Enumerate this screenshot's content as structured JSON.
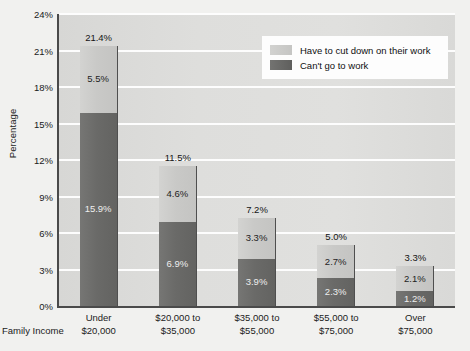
{
  "chart_data": {
    "type": "bar",
    "stacked": true,
    "title": "",
    "xlabel": "Family Income",
    "ylabel": "Percentage",
    "ylim": [
      0,
      24
    ],
    "yticks": [
      "0%",
      "3%",
      "6%",
      "9%",
      "12%",
      "15%",
      "18%",
      "21%",
      "24%"
    ],
    "ytick_values": [
      0,
      3,
      6,
      9,
      12,
      15,
      18,
      21,
      24
    ],
    "grid": true,
    "legend_position": "top-right",
    "categories": [
      "Under\n$20,000",
      "$20,000 to\n$35,000",
      "$35,000 to\n$55,000",
      "$55,000 to\n$75,000",
      "Over\n$75,000"
    ],
    "category_lines": [
      [
        "Under",
        "$20,000"
      ],
      [
        "$20,000 to",
        "$35,000"
      ],
      [
        "$35,000 to",
        "$55,000"
      ],
      [
        "$55,000 to",
        "$75,000"
      ],
      [
        "Over",
        "$75,000"
      ]
    ],
    "series": [
      {
        "name": "Can't go to work",
        "color": "#6a6a68",
        "values": [
          15.9,
          6.9,
          3.9,
          2.3,
          1.2
        ],
        "labels": [
          "15.9%",
          "6.9%",
          "3.9%",
          "2.3%",
          "1.2%"
        ]
      },
      {
        "name": "Have to cut down on their work",
        "color": "#c9c9c7",
        "values": [
          5.5,
          4.6,
          3.3,
          2.7,
          2.1
        ],
        "labels": [
          "5.5%",
          "4.6%",
          "3.3%",
          "2.7%",
          "2.1%"
        ]
      }
    ],
    "totals": [
      21.4,
      11.5,
      7.2,
      5.0,
      3.3
    ],
    "total_labels": [
      "21.4%",
      "11.5%",
      "7.2%",
      "5.0%",
      "3.3%"
    ]
  },
  "legend": {
    "items": [
      {
        "label": "Have to cut down on their work",
        "swatch": "light"
      },
      {
        "label": "Can't go to work",
        "swatch": "dark"
      }
    ]
  },
  "colors": {
    "plot_background": "#dadad8",
    "page_background": "#f1f1ef",
    "gridline": "#fdfdfd",
    "axis": "#4a4a4a",
    "series_light": "#c9c9c7",
    "series_dark": "#6a6a68",
    "text": "#1b1b1b"
  }
}
